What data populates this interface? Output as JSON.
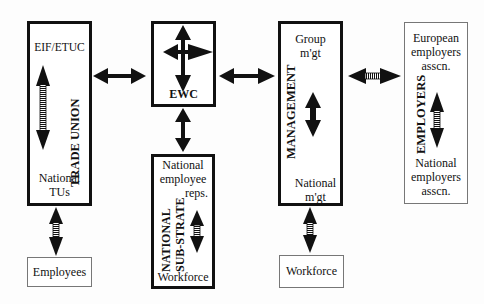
{
  "diagram": {
    "nodes": {
      "trade_union": {
        "title": "TRADE UNION",
        "top_label": "EIF/ETUC",
        "bottom_label_line1": "National",
        "bottom_label_line2": "TUs"
      },
      "ewc": {
        "title": "EWC"
      },
      "national_substrate": {
        "title_line1": "NATIONAL",
        "title_line2": "SUB-STRATE",
        "top_label_line1": "National",
        "top_label_line2": "employee",
        "top_label_line3": "reps.",
        "bottom_label": "Workforce"
      },
      "management": {
        "title": "MANAGEMENT",
        "top_label_line1": "Group",
        "top_label_line2": "m'gt",
        "bottom_label_line1": "National",
        "bottom_label_line2": "m'gt"
      },
      "employers": {
        "title": "EMPLOYERS",
        "top_label_line1": "European",
        "top_label_line2": "employers",
        "top_label_line3": "asscn.",
        "bottom_label_line1": "National",
        "bottom_label_line2": "employers",
        "bottom_label_line3": "asscn."
      },
      "employees": {
        "label": "Employees"
      },
      "workforce": {
        "label": "Workforce"
      }
    },
    "edges": [
      {
        "from": "trade_union",
        "to": "ewc",
        "style": "solid",
        "direction": "both"
      },
      {
        "from": "ewc",
        "to": "management",
        "style": "solid",
        "direction": "both"
      },
      {
        "from": "management",
        "to": "employers",
        "style": "hatched",
        "direction": "both"
      },
      {
        "from": "ewc",
        "to": "national_substrate",
        "style": "solid",
        "direction": "both"
      },
      {
        "from": "trade_union",
        "to": "employees",
        "style": "hatched",
        "direction": "both"
      },
      {
        "from": "management",
        "to": "workforce",
        "style": "hatched",
        "direction": "both"
      }
    ],
    "colors": {
      "border_strong": "#111111",
      "border_light": "#777777",
      "background": "#fdfdfd"
    }
  }
}
